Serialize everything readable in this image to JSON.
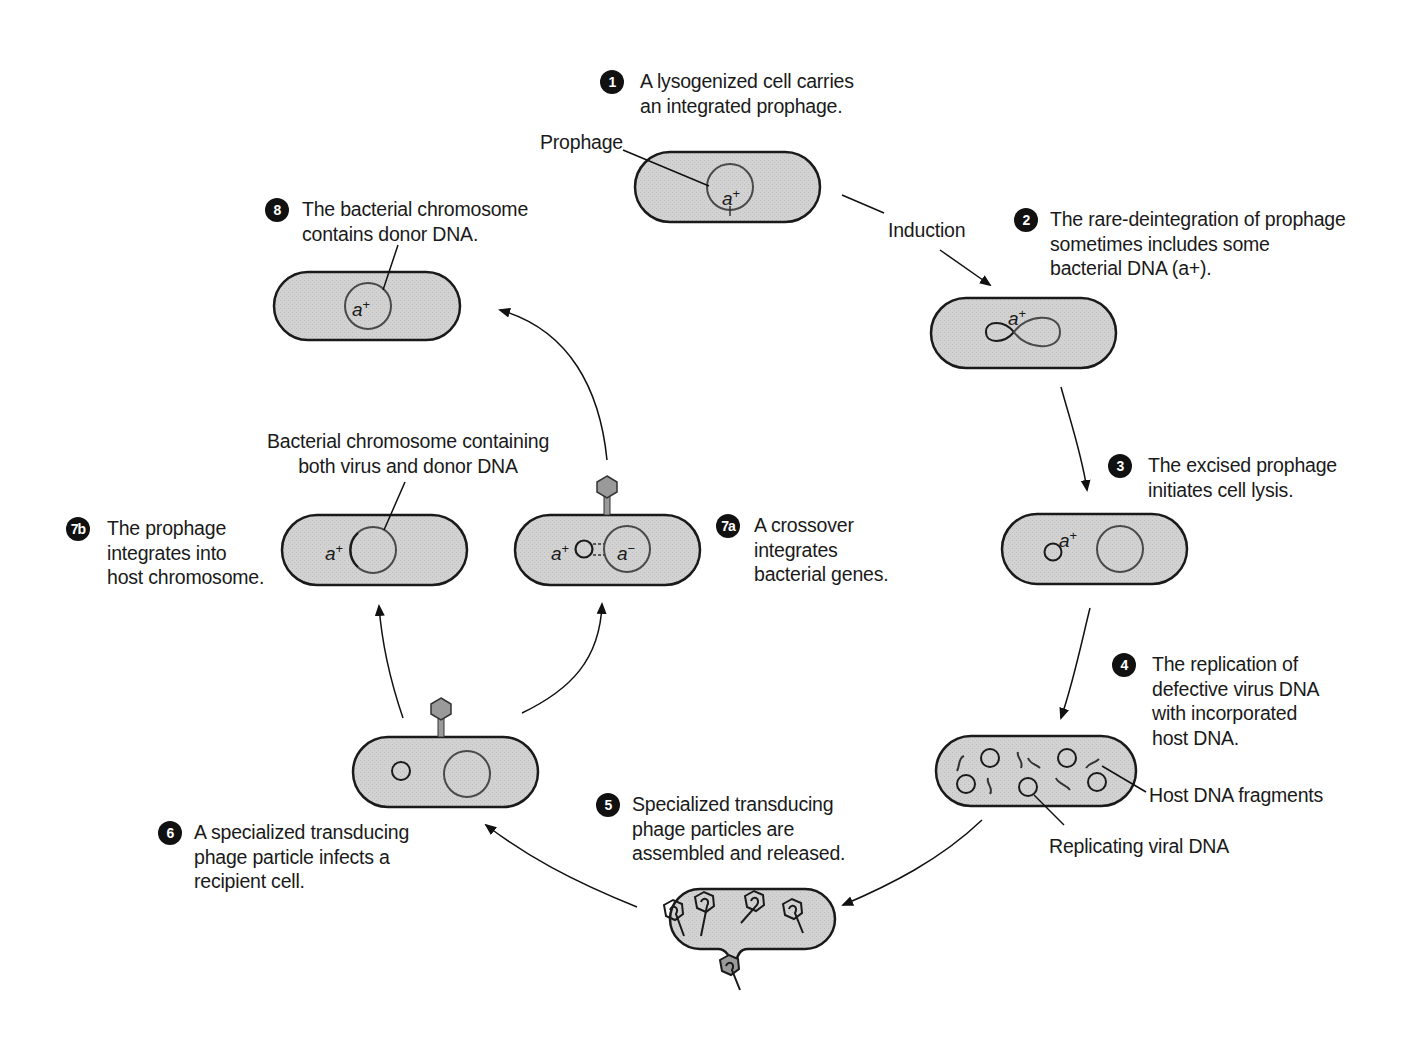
{
  "figure": {
    "colors": {
      "cell_fill": "#cfcfcf",
      "cell_stroke": "#1a1a1a",
      "chromosome_stroke": "#4a4a4a",
      "badge": "#111111",
      "phage_fill": "#9a9a9a",
      "background": "#ffffff"
    }
  },
  "steps": [
    {
      "id": "1",
      "badge": "1",
      "text": "A lysogenized cell carries\nan integrated prophage."
    },
    {
      "id": "2",
      "badge": "2",
      "text": "The rare-deintegration of prophage\nsometimes includes some\nbacterial DNA (a+)."
    },
    {
      "id": "3",
      "badge": "3",
      "text": "The excised prophage\ninitiates cell lysis."
    },
    {
      "id": "4",
      "badge": "4",
      "text": "The replication of\ndefective virus DNA\nwith incorporated\nhost DNA."
    },
    {
      "id": "5",
      "badge": "5",
      "text": "Specialized transducing\nphage particles are\nassembled and released."
    },
    {
      "id": "6",
      "badge": "6",
      "text": "A specialized transducing\nphage particle infects a\nrecipient cell."
    },
    {
      "id": "7a",
      "badge": "7a",
      "text": "A crossover\nintegrates\nbacterial genes."
    },
    {
      "id": "7b",
      "badge": "7b",
      "text": "The prophage\nintegrates into\nhost chromosome."
    },
    {
      "id": "8",
      "badge": "8",
      "text": "The bacterial chromosome\ncontains donor DNA."
    }
  ],
  "labels": {
    "prophage": "Prophage",
    "induction": "Induction",
    "host_dna_fragments": "Host DNA fragments",
    "replicating_viral_dna": "Replicating viral DNA",
    "bacterial_chromosome_both": "Bacterial chromosome containing\nboth virus and donor DNA"
  },
  "genes": {
    "a_base": "a",
    "plus": "+",
    "minus": "−"
  }
}
